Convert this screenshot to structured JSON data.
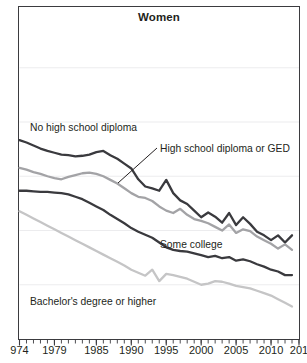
{
  "chart_data": {
    "type": "line",
    "title": "Women",
    "xlabel": "",
    "ylabel": "",
    "grid": true,
    "legend_position": "inline-annotations",
    "xlim": [
      1974,
      2014
    ],
    "ylim": [
      0,
      55
    ],
    "x_tick_labels": [
      "974",
      "1979",
      "1985",
      "1990",
      "1995",
      "2000",
      "2005",
      "2010",
      "201"
    ],
    "x_tick_years": [
      1974,
      1979,
      1985,
      1990,
      1995,
      2000,
      2005,
      2010,
      2014
    ],
    "x_minor_tick_years": [
      1974,
      1975,
      1976,
      1977,
      1978,
      1979,
      1980,
      1981,
      1982,
      1983,
      1984,
      1985,
      1986,
      1987,
      1988,
      1989,
      1990,
      1991,
      1992,
      1993,
      1994,
      1995,
      1996,
      1997,
      1998,
      1999,
      2000,
      2001,
      2002,
      2003,
      2004,
      2005,
      2006,
      2007,
      2008,
      2009,
      2010,
      2011,
      2012,
      2013,
      2014
    ],
    "gridline_values": [
      45,
      36,
      27,
      18,
      9
    ],
    "x": [
      1974,
      1975,
      1976,
      1977,
      1978,
      1979,
      1980,
      1981,
      1982,
      1983,
      1984,
      1985,
      1986,
      1987,
      1988,
      1989,
      1990,
      1991,
      1992,
      1993,
      1994,
      1995,
      1996,
      1997,
      1998,
      1999,
      2000,
      2001,
      2002,
      2003,
      2004,
      2005,
      2006,
      2007,
      2008,
      2009,
      2010,
      2011,
      2012,
      2013
    ],
    "series": [
      {
        "name": "No high school diploma",
        "color": "#3a3a3e",
        "label_x": 30,
        "label_y": 122,
        "values": [
          33.0,
          32.6,
          32.1,
          31.6,
          31.2,
          30.9,
          30.6,
          30.5,
          30.3,
          30.4,
          30.6,
          31.0,
          31.2,
          30.5,
          29.9,
          29.1,
          28.3,
          26.5,
          25.3,
          25.0,
          24.6,
          26.4,
          24.2,
          23.0,
          22.4,
          21.3,
          20.2,
          21.0,
          20.3,
          19.3,
          20.9,
          18.9,
          20.2,
          19.1,
          17.8,
          17.2,
          16.4,
          17.2,
          16.0,
          17.2
        ]
      },
      {
        "name": "High school diploma or GED",
        "color": "#a3a3a6",
        "label_x": 160,
        "label_y": 143,
        "leader": {
          "x1": 157,
          "y1": 148,
          "x2": 118,
          "y2": 183
        },
        "values": [
          28.4,
          28.1,
          27.7,
          27.4,
          27.0,
          26.7,
          26.5,
          26.9,
          27.2,
          27.5,
          27.6,
          27.4,
          27.0,
          26.4,
          25.8,
          25.0,
          24.2,
          23.6,
          23.4,
          22.9,
          22.0,
          21.3,
          20.9,
          21.6,
          20.6,
          19.9,
          19.6,
          19.2,
          18.6,
          18.0,
          19.0,
          17.6,
          18.2,
          17.9,
          17.0,
          16.4,
          15.8,
          15.0,
          15.7,
          14.8
        ]
      },
      {
        "name": "Some college",
        "color": "#3a3a3e",
        "label_x": 160,
        "label_y": 239,
        "values": [
          24.6,
          24.6,
          24.5,
          24.4,
          24.4,
          24.3,
          24.2,
          24.0,
          23.6,
          23.2,
          22.6,
          22.0,
          21.4,
          20.6,
          19.9,
          19.2,
          18.4,
          17.8,
          17.3,
          16.8,
          16.0,
          15.2,
          14.8,
          14.6,
          14.5,
          14.2,
          13.9,
          13.6,
          13.8,
          13.4,
          13.6,
          13.0,
          13.2,
          12.9,
          12.4,
          12.0,
          11.5,
          11.2,
          10.6,
          10.6
        ]
      },
      {
        "name": "Bachelor's degree or higher",
        "color": "#c5c5c6",
        "label_x": 30,
        "label_y": 296,
        "values": [
          21.2,
          20.6,
          20.0,
          19.4,
          18.8,
          18.2,
          17.6,
          17.0,
          16.4,
          15.8,
          15.2,
          14.6,
          14.0,
          13.4,
          12.8,
          12.2,
          11.5,
          11.0,
          10.5,
          11.5,
          9.6,
          10.8,
          10.6,
          10.3,
          10.0,
          9.5,
          9.0,
          9.2,
          9.6,
          9.5,
          9.2,
          8.8,
          8.6,
          8.4,
          8.0,
          7.6,
          7.2,
          6.6,
          6.0,
          5.4
        ]
      }
    ]
  }
}
